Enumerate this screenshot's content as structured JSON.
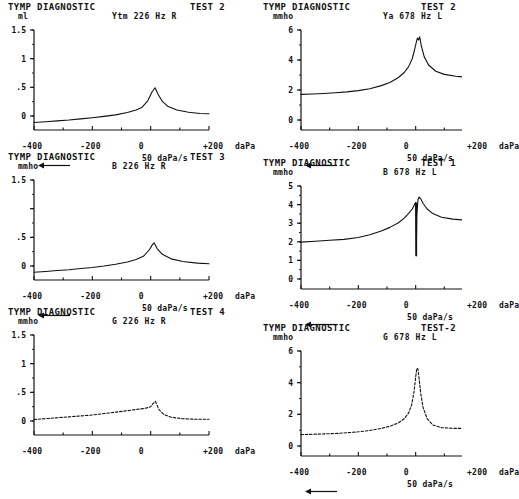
{
  "document": {
    "kind": "tympanometry-diagnostic-printout",
    "panel_title": "TYMP DIAGNOSTIC",
    "x_axis_label": "daPa",
    "sweep_rate": "50 daPa/s",
    "x_ticks": [
      "-400",
      "-200",
      "0",
      "+200"
    ]
  },
  "panels": [
    {
      "id": "panel-test2-226",
      "title": "TYMP DIAGNOSTIC",
      "test": "TEST 2",
      "unit": "ml",
      "param": "Ytm   226 Hz R",
      "x_label": "daPa",
      "sweep": "50 daPa/s",
      "show_sweep": true,
      "y_ticks": [
        "1.5",
        "1",
        ".5",
        "0"
      ],
      "chart_data": {
        "type": "line",
        "title": "TYMP DIAGNOSTIC TEST 2",
        "series_name": "Ytm 226 Hz R",
        "xlabel": "daPa",
        "ylabel": "ml",
        "xlim": [
          -400,
          200
        ],
        "ylim": [
          -0.25,
          1.5
        ],
        "grid": false,
        "legend": "none",
        "x": [
          -400,
          -360,
          -320,
          -280,
          -240,
          -200,
          -160,
          -120,
          -80,
          -50,
          -30,
          -10,
          5,
          15,
          25,
          40,
          60,
          90,
          130,
          170,
          200
        ],
        "y": [
          -0.12,
          -0.105,
          -0.09,
          -0.075,
          -0.055,
          -0.035,
          -0.012,
          0.015,
          0.055,
          0.1,
          0.145,
          0.26,
          0.42,
          0.49,
          0.38,
          0.25,
          0.16,
          0.1,
          0.06,
          0.04,
          0.035
        ]
      }
    },
    {
      "id": "panel-test3-226",
      "title": "TYMP DIAGNOSTIC",
      "test": "TEST 3",
      "unit": "mmho",
      "param": "B    226 Hz R",
      "x_label": "daPa",
      "sweep": "50 daPa/s",
      "show_sweep": true,
      "y_ticks": [
        "1.5",
        "",
        ".5",
        "0"
      ],
      "chart_data": {
        "type": "line",
        "title": "TYMP DIAGNOSTIC TEST 3",
        "series_name": "B 226 Hz R",
        "xlabel": "daPa",
        "ylabel": "mmho",
        "xlim": [
          -400,
          200
        ],
        "ylim": [
          -0.25,
          1.5
        ],
        "grid": false,
        "legend": "none",
        "x": [
          -400,
          -360,
          -320,
          -280,
          -240,
          -200,
          -160,
          -120,
          -80,
          -50,
          -25,
          -5,
          5,
          12,
          22,
          40,
          70,
          110,
          160,
          200
        ],
        "y": [
          -0.115,
          -0.1,
          -0.085,
          -0.07,
          -0.05,
          -0.03,
          -0.005,
          0.025,
          0.065,
          0.11,
          0.165,
          0.275,
          0.36,
          0.4,
          0.3,
          0.2,
          0.12,
          0.075,
          0.045,
          0.035
        ]
      }
    },
    {
      "id": "panel-test4-226",
      "title": "TYMP DIAGNOSTIC",
      "test": "TEST 4",
      "unit": "mmho",
      "param": "G    226 Hz R",
      "x_label": "daPa",
      "sweep": "",
      "show_sweep": false,
      "y_ticks": [
        "1.5",
        "1",
        ".5",
        "0"
      ],
      "chart_data": {
        "type": "line",
        "title": "TYMP DIAGNOSTIC TEST 4",
        "series_name": "G 226 Hz R",
        "xlabel": "daPa",
        "ylabel": "mmho",
        "xlim": [
          -400,
          200
        ],
        "ylim": [
          -0.25,
          1.5
        ],
        "grid": false,
        "legend": "none",
        "style": "dashed",
        "x": [
          -400,
          -350,
          -300,
          -250,
          -200,
          -160,
          -120,
          -80,
          -45,
          -20,
          0,
          8,
          16,
          28,
          45,
          70,
          110,
          160,
          200
        ],
        "y": [
          0.02,
          0.04,
          0.06,
          0.08,
          0.1,
          0.125,
          0.15,
          0.175,
          0.2,
          0.215,
          0.245,
          0.3,
          0.34,
          0.2,
          0.11,
          0.06,
          0.035,
          0.025,
          0.025
        ]
      }
    },
    {
      "id": "panel-test2-678",
      "title": "TYMP DIAGNOSTIC",
      "test": "TEST 2",
      "unit": "mmho",
      "param": "Ya   678 Hz L",
      "x_label": "daPa",
      "sweep": "50 daPa/s",
      "show_sweep": true,
      "y_ticks": [
        "6",
        "4",
        "2",
        "0"
      ],
      "chart_data": {
        "type": "line",
        "title": "TYMP DIAGNOSTIC TEST 2",
        "series_name": "Ya 678 Hz L",
        "xlabel": "daPa",
        "ylabel": "mmho",
        "xlim": [
          -400,
          200
        ],
        "ylim": [
          -0.6,
          7.4
        ],
        "grid": false,
        "legend": "none",
        "x": [
          -400,
          -360,
          -320,
          -280,
          -240,
          -200,
          -160,
          -120,
          -90,
          -60,
          -40,
          -25,
          -12,
          -4,
          2,
          6,
          10,
          14,
          20,
          30,
          45,
          70,
          100,
          140,
          180,
          200
        ],
        "y": [
          2.25,
          2.28,
          2.32,
          2.38,
          2.45,
          2.55,
          2.7,
          2.95,
          3.2,
          3.6,
          4.0,
          4.45,
          5.1,
          5.8,
          6.4,
          6.75,
          6.6,
          6.85,
          6.1,
          5.25,
          4.6,
          4.1,
          3.85,
          3.7,
          3.6,
          3.58
        ]
      }
    },
    {
      "id": "panel-test1-678",
      "title": "TYMP DIAGNOSTIC",
      "test": "TEST 1",
      "unit": "mmho",
      "param": "B    678 Hz L",
      "x_label": "daPa",
      "sweep": "50 daPa/s",
      "show_sweep": true,
      "y_ticks": [
        "5",
        "4",
        "3",
        "2",
        "1",
        "0"
      ],
      "chart_data": {
        "type": "line",
        "title": "TYMP DIAGNOSTIC TEST 1",
        "series_name": "B 678 Hz L",
        "xlabel": "daPa",
        "ylabel": "mmho",
        "xlim": [
          -400,
          200
        ],
        "ylim": [
          -0.4,
          5.2
        ],
        "grid": false,
        "legend": "none",
        "notch": {
          "x": 2,
          "y_min": 1.4,
          "y_max": 4.3
        },
        "x": [
          -400,
          -350,
          -300,
          -250,
          -200,
          -160,
          -120,
          -90,
          -60,
          -40,
          -25,
          -12,
          -4,
          0,
          2,
          4,
          8,
          12,
          18,
          26,
          40,
          60,
          90,
          130,
          170,
          200
        ],
        "y": [
          2.15,
          2.2,
          2.25,
          2.3,
          2.4,
          2.55,
          2.75,
          2.95,
          3.2,
          3.45,
          3.7,
          3.95,
          4.2,
          4.3,
          1.4,
          3.6,
          4.45,
          4.6,
          4.5,
          4.25,
          3.95,
          3.7,
          3.5,
          3.4,
          3.35,
          3.35
        ]
      }
    },
    {
      "id": "panel-test2b-678",
      "title": "TYMP DIAGNOSTIC",
      "test": "TEST-2",
      "unit": "mmho",
      "param": "G    678 Hz L",
      "x_label": "daPa",
      "sweep": "50 daPa/s",
      "show_sweep": true,
      "y_ticks": [
        "6",
        "4",
        "2",
        "0"
      ],
      "chart_data": {
        "type": "line",
        "title": "TYMP DIAGNOSTIC TEST-2",
        "series_name": "G 678 Hz L",
        "xlabel": "daPa",
        "ylabel": "mmho",
        "xlim": [
          -400,
          200
        ],
        "ylim": [
          -0.6,
          7.0
        ],
        "grid": false,
        "legend": "none",
        "style": "dashed",
        "x": [
          -400,
          -360,
          -320,
          -280,
          -240,
          -200,
          -160,
          -120,
          -90,
          -60,
          -40,
          -25,
          -14,
          -6,
          0,
          4,
          8,
          12,
          18,
          26,
          40,
          60,
          90,
          130,
          170,
          200
        ],
        "y": [
          0.95,
          0.97,
          1.0,
          1.03,
          1.08,
          1.15,
          1.25,
          1.4,
          1.55,
          1.8,
          2.1,
          2.5,
          3.1,
          4.0,
          5.1,
          5.75,
          5.7,
          5.0,
          3.9,
          2.9,
          2.1,
          1.65,
          1.45,
          1.4,
          1.4,
          1.4
        ]
      }
    }
  ]
}
